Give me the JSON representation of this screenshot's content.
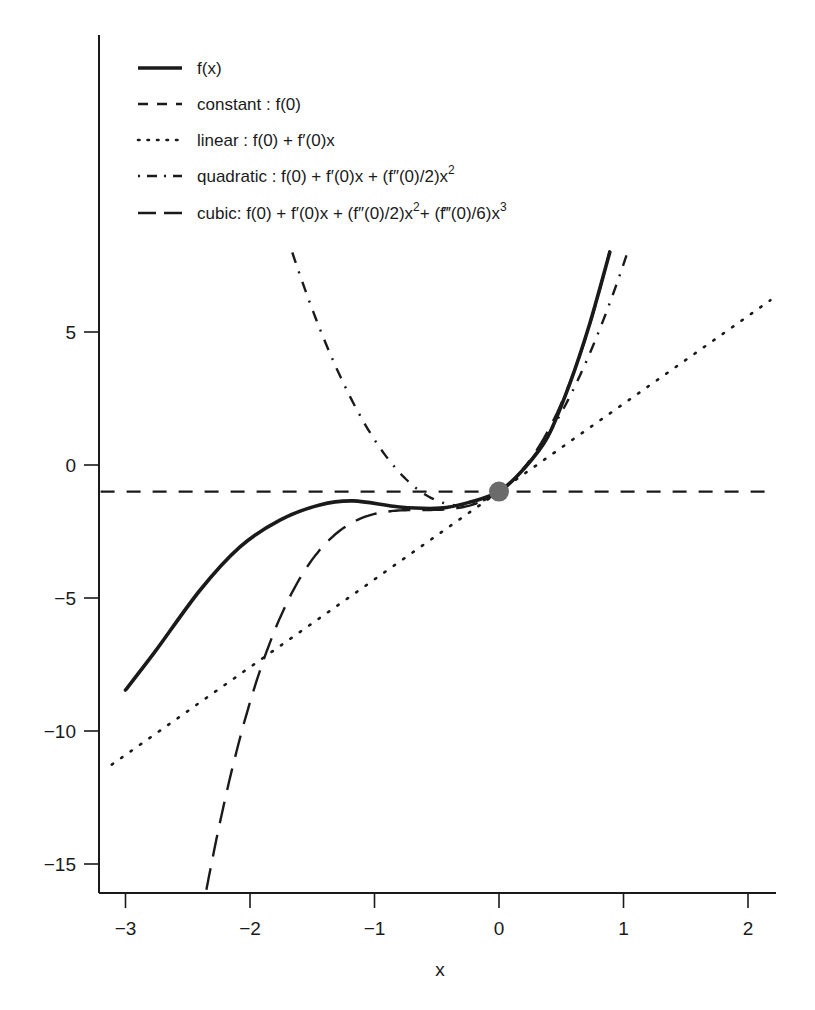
{
  "chart_data": {
    "type": "line",
    "title": "",
    "xlabel": "x",
    "ylabel": "",
    "xlim": [
      -3.2,
      2.2
    ],
    "ylim": [
      -16.1,
      16.2
    ],
    "x_ticks": [
      -3,
      -2,
      -1,
      0,
      1,
      2
    ],
    "x_tick_labels": [
      "−3",
      "−2",
      "−1",
      "0",
      "1",
      "2"
    ],
    "y_ticks": [
      5,
      0,
      -5,
      -10,
      -15
    ],
    "y_tick_labels": [
      "5",
      "0",
      "−5",
      "−10",
      "−15"
    ],
    "grid": false,
    "legend_position": "upper-left",
    "expansion_point": {
      "x": 0,
      "y": -1,
      "color": "#6b6b6b"
    },
    "coefficients": {
      "f0": -1,
      "f1": 3.3,
      "f2_half": 5.25,
      "f3_sixth": 2.79
    },
    "series": [
      {
        "name": "f(x)",
        "style": "solid",
        "points": [
          [
            -3,
            -8.46
          ],
          [
            -2.76,
            -7.0
          ],
          [
            -2.4,
            -4.7
          ],
          [
            -2.08,
            -3.08
          ],
          [
            -1.76,
            -2.07
          ],
          [
            -1.44,
            -1.5
          ],
          [
            -1.17,
            -1.35
          ],
          [
            -0.8,
            -1.58
          ],
          [
            -0.47,
            -1.62
          ],
          [
            -0.23,
            -1.39
          ],
          [
            0,
            -1
          ],
          [
            0.19,
            -0.19
          ],
          [
            0.39,
            1.05
          ],
          [
            0.57,
            3.08
          ],
          [
            0.73,
            5.33
          ],
          [
            0.89,
            8.0
          ]
        ]
      },
      {
        "name": "constant : f(0)",
        "style": "dashed",
        "order": 0,
        "x_range": [
          -3.2,
          2.2
        ]
      },
      {
        "name": "linear : f(0) + f′(0)x",
        "style": "dotted",
        "order": 1,
        "x_range": [
          -3.11,
          2.18
        ]
      },
      {
        "name": "quadratic : f(0) + f′(0)x + (f″(0)/2)x²",
        "style": "dashdot",
        "order": 2,
        "x_range": [
          -1.66,
          1.04
        ]
      },
      {
        "name": "cubic: f(0) + f′(0)x + (f″(0)/2)x²+ (f‴(0)/6)x³",
        "style": "longdash",
        "order": 3,
        "x_range": [
          -2.35,
          0.89
        ]
      }
    ]
  },
  "legend": {
    "items": [
      {
        "label": "f(x)",
        "style": "solid"
      },
      {
        "label": "constant : f(0)",
        "style": "dashed"
      },
      {
        "label": "linear : f(0) + f′(0)x",
        "style": "dotted"
      },
      {
        "label_parts": [
          "quadratic : f(0) + f′(0)x + (f″(0)/2)x",
          "2"
        ],
        "style": "dashdot"
      },
      {
        "label_parts": [
          "cubic: f(0) + f′(0)x + (f″(0)/2)x",
          "2",
          "+ (f‴(0)/6)x",
          "3"
        ],
        "style": "longdash"
      }
    ]
  },
  "colors": {
    "ink": "#1a1a1a",
    "point": "#6b6b6b",
    "background": "#ffffff"
  }
}
